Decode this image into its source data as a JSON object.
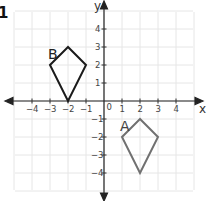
{
  "problem_number": "1",
  "axes": {
    "x_label": "x",
    "y_label": "y",
    "origin_label": "0",
    "x_ticks": [
      "-4",
      "-3",
      "-2",
      "-1",
      "1",
      "2",
      "3",
      "4"
    ],
    "y_ticks": [
      "4",
      "3",
      "2",
      "1",
      "-1",
      "-2",
      "-3",
      "-4"
    ]
  },
  "shapes": [
    {
      "label": "B",
      "color": "#1a1a1a",
      "vertices": [
        [
          -2,
          3
        ],
        [
          -3,
          2
        ],
        [
          -2,
          0
        ],
        [
          -1,
          2
        ]
      ]
    },
    {
      "label": "A",
      "color": "#707070",
      "vertices": [
        [
          2,
          -1
        ],
        [
          1,
          -2
        ],
        [
          2,
          -4
        ],
        [
          3,
          -2
        ]
      ]
    }
  ],
  "colors": {
    "grid": "#e6e6e6",
    "axis": "#222222"
  }
}
